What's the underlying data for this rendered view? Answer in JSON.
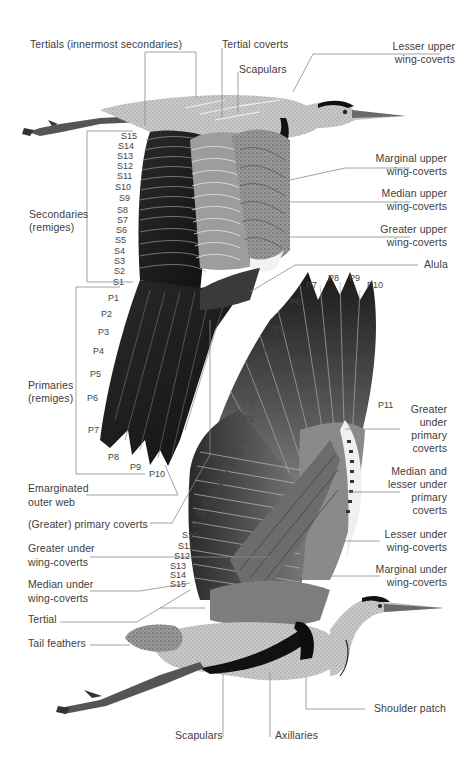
{
  "upper_figure": {
    "labels": {
      "tertials": "Tertials (innermost secondaries)",
      "tertial_coverts": "Tertial coverts",
      "scapulars": "Scapulars",
      "lesser_upper_1": "Lesser upper",
      "lesser_upper_2": "wing-coverts",
      "marginal_upper_1": "Marginal upper",
      "marginal_upper_2": "wing-coverts",
      "median_upper_1": "Median upper",
      "median_upper_2": "wing-coverts",
      "greater_upper_1": "Greater upper",
      "greater_upper_2": "wing-coverts",
      "alula": "Alula",
      "secondaries_1": "Secondaries",
      "secondaries_2": "(remiges)",
      "primaries_1": "Primaries",
      "primaries_2": "(remiges)",
      "emarginated_1": "Emarginated",
      "emarginated_2": "outer web",
      "primary_coverts": "(Greater) primary coverts"
    },
    "secondaries": [
      "S15",
      "S14",
      "S13",
      "S12",
      "S11",
      "S10",
      "S9",
      "S8",
      "S7",
      "S6",
      "S5",
      "S4",
      "S3",
      "S2",
      "S1"
    ],
    "primaries": [
      "P1",
      "P2",
      "P3",
      "P4",
      "P5",
      "P6",
      "P7",
      "P8",
      "P9",
      "P10"
    ]
  },
  "lower_figure": {
    "labels": {
      "greater_under_primary_1": "Greater",
      "greater_under_primary_2": "under",
      "greater_under_primary_3": "primary",
      "greater_under_primary_4": "coverts",
      "median_lesser_1": "Median and",
      "median_lesser_2": "lesser under",
      "median_lesser_3": "primary",
      "median_lesser_4": "coverts",
      "lesser_under_1": "Lesser under",
      "lesser_under_2": "wing-coverts",
      "marginal_under_1": "Marginal under",
      "marginal_under_2": "wing-coverts",
      "greater_under_wc_1": "Greater under",
      "greater_under_wc_2": "wing-coverts",
      "median_under_wc_1": "Median under",
      "median_under_wc_2": "wing-coverts",
      "tertial": "Tertial",
      "tail_feathers": "Tail feathers",
      "scapulars": "Scapulars",
      "axillaries": "Axillaries",
      "shoulder_patch": "Shoulder patch"
    },
    "primaries_top": [
      "P7",
      "P8",
      "P9",
      "P10"
    ],
    "primaries_side": [
      "P6",
      "P5",
      "P4",
      "P3",
      "P2",
      "P1"
    ],
    "p11": "P11",
    "secondaries": [
      "S1",
      "S2",
      "S3",
      "S4",
      "S5",
      "S6",
      "S7",
      "S8",
      "S9",
      "S10",
      "S11",
      "S12",
      "S13",
      "S14",
      "S15"
    ]
  },
  "colors": {
    "ink": "#3d3d3d",
    "leader": "#8a8a8a",
    "dark_feather": "#1e1e1e",
    "mid_feather": "#6d6d6d",
    "light_feather": "#b4b4b4",
    "background": "#ffffff"
  }
}
